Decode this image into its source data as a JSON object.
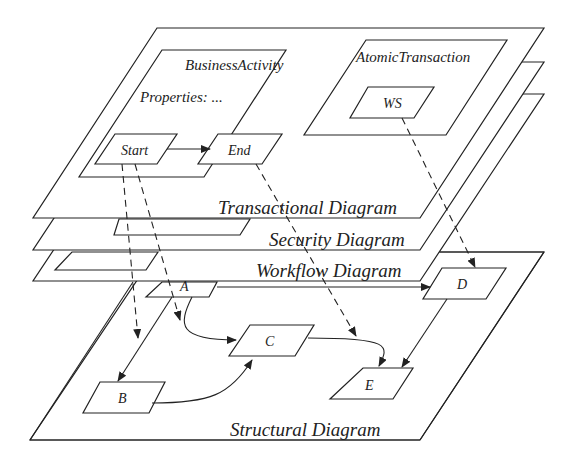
{
  "diagram": {
    "planes": {
      "transactional": "Transactional Diagram",
      "security": "Security Diagram",
      "workflow": "Workflow Diagram",
      "structural": "Structural Diagram"
    },
    "containers": {
      "business_activity": "BusinessActivity",
      "properties": "Properties: ...",
      "atomic_transaction": "AtomicTransaction"
    },
    "nodes": {
      "start": "Start",
      "end": "End",
      "ws": "WS",
      "a": "A",
      "b": "B",
      "c": "C",
      "d": "D",
      "e": "E"
    }
  },
  "colors": {
    "stroke": "#222222",
    "background": "#ffffff"
  }
}
